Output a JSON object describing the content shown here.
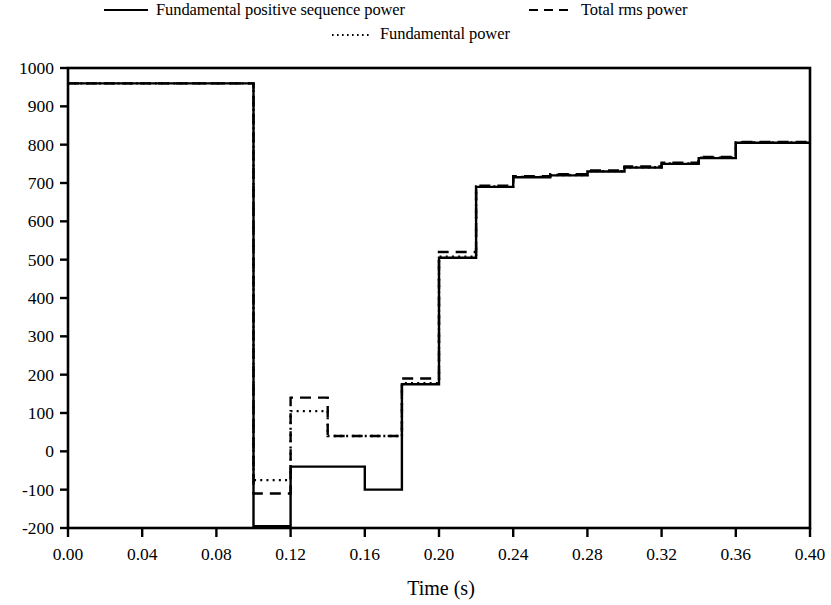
{
  "legend": {
    "entries": [
      {
        "label": "Fundamental positive sequence power",
        "style": "solid",
        "name": "legend-item-fundamental-positive-sequence-power"
      },
      {
        "label": "Total rms power",
        "style": "dashed",
        "name": "legend-item-total-rms-power"
      },
      {
        "label": "Fundamental power",
        "style": "dotted",
        "name": "legend-item-fundamental-power"
      }
    ]
  },
  "chart_data": {
    "type": "line",
    "title": "",
    "xlabel": "Time (s)",
    "ylabel": "",
    "xlim": [
      0.0,
      0.4
    ],
    "ylim": [
      -200,
      1000
    ],
    "xticks": [
      "0.00",
      "0.04",
      "0.08",
      "0.12",
      "0.16",
      "0.20",
      "0.24",
      "0.28",
      "0.32",
      "0.36",
      "0.40"
    ],
    "xtick_values": [
      0.0,
      0.04,
      0.08,
      0.12,
      0.16,
      0.2,
      0.24,
      0.28,
      0.32,
      0.36,
      0.4
    ],
    "yticks": [
      "1000",
      "900",
      "800",
      "700",
      "600",
      "500",
      "400",
      "300",
      "200",
      "100",
      "0",
      "-100",
      "-200"
    ],
    "ytick_values": [
      1000,
      900,
      800,
      700,
      600,
      500,
      400,
      300,
      200,
      100,
      0,
      -100,
      -200
    ],
    "grid": false,
    "legend_position": "above-plot",
    "interpolation": "step-post",
    "series": [
      {
        "name": "Fundamental positive sequence power",
        "style": "solid",
        "x": [
          0.0,
          0.1,
          0.12,
          0.14,
          0.16,
          0.18,
          0.2,
          0.22,
          0.24,
          0.26,
          0.28,
          0.3,
          0.32,
          0.34,
          0.36,
          0.4
        ],
        "values": [
          960,
          -195,
          -40,
          -40,
          -100,
          175,
          505,
          690,
          715,
          720,
          730,
          740,
          750,
          765,
          805,
          805
        ]
      },
      {
        "name": "Total rms power",
        "style": "dashed",
        "x": [
          0.0,
          0.1,
          0.12,
          0.14,
          0.16,
          0.18,
          0.2,
          0.22,
          0.24,
          0.26,
          0.28,
          0.3,
          0.32,
          0.34,
          0.36,
          0.4
        ],
        "values": [
          960,
          -110,
          140,
          40,
          40,
          190,
          520,
          693,
          718,
          723,
          733,
          743,
          753,
          768,
          807,
          807
        ]
      },
      {
        "name": "Fundamental power",
        "style": "dotted",
        "x": [
          0.0,
          0.1,
          0.12,
          0.14,
          0.16,
          0.18,
          0.2,
          0.22,
          0.24,
          0.26,
          0.28,
          0.3,
          0.32,
          0.34,
          0.36,
          0.4
        ],
        "values": [
          960,
          -75,
          105,
          40,
          40,
          178,
          508,
          691,
          716,
          721,
          731,
          741,
          751,
          766,
          806,
          806
        ]
      }
    ]
  }
}
